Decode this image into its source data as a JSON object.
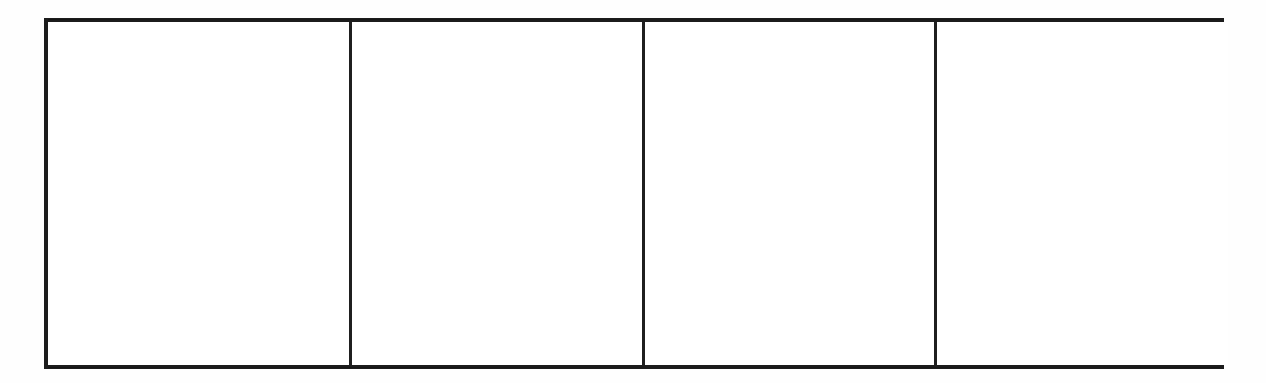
{
  "document": {
    "type": "blank-ruled-table",
    "description": "Empty four-column table outline on a white scanned page",
    "background_color": "#ffffff",
    "page_color": "#fefefe"
  },
  "table": {
    "border_color": "#1c1c1c",
    "divider_color": "#1f1f1f",
    "cell_background": "#ffffff",
    "outer_border_width_px": 4,
    "divider_width_px": 3,
    "frame": {
      "x": 44,
      "y": 18,
      "width": 1180,
      "height": 351
    },
    "column_count": 4,
    "row_count": 1,
    "divider_x_positions": [
      345,
      638,
      930
    ],
    "columns": [
      {
        "index": 1,
        "width_px": 301,
        "content": ""
      },
      {
        "index": 2,
        "width_px": 293,
        "content": ""
      },
      {
        "index": 3,
        "width_px": 292,
        "content": ""
      },
      {
        "index": 4,
        "width_px": 294,
        "content": ""
      }
    ],
    "cells": [
      {
        "id": "cell-1",
        "column": 1,
        "content": ""
      },
      {
        "id": "cell-2",
        "column": 2,
        "content": ""
      },
      {
        "id": "cell-3",
        "column": 3,
        "content": ""
      },
      {
        "id": "cell-4",
        "column": 4,
        "content": ""
      }
    ]
  }
}
